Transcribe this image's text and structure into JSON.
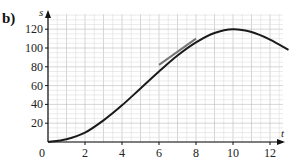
{
  "part_label": "b)",
  "chart_data": {
    "type": "line",
    "title": "",
    "xlabel": "t",
    "ylabel": "s",
    "xlim": [
      0,
      13
    ],
    "ylim": [
      0,
      125
    ],
    "x_ticks": [
      2,
      4,
      6,
      8,
      10,
      12
    ],
    "y_ticks": [
      20,
      40,
      60,
      80,
      100,
      120
    ],
    "origin_label": "0",
    "grid": true,
    "series": [
      {
        "name": "s(t)",
        "x": [
          0,
          1,
          2,
          3,
          4,
          5,
          6,
          7,
          8,
          9,
          10,
          11,
          12,
          13
        ],
        "values": [
          0,
          3,
          10,
          23,
          39,
          57,
          75,
          92,
          106,
          116,
          120,
          117,
          109,
          98
        ]
      }
    ],
    "annotations": [
      {
        "type": "tangent_line",
        "from": [
          6,
          82
        ],
        "to": [
          8,
          110
        ],
        "color": "#777777"
      }
    ]
  },
  "colors": {
    "curve": "#1a1a1a",
    "grid_minor": "#dddddd",
    "grid_major": "#bbbbbb",
    "axis": "#111111",
    "tangent": "#777777"
  }
}
